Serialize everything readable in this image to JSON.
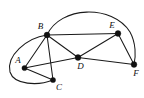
{
  "figure": {
    "width": 144,
    "height": 98,
    "background_color": "#ffffff",
    "stroke_color": "#1a1a1a",
    "vertex_color": "#111111"
  },
  "graph": {
    "vertices": [
      {
        "id": "A",
        "label": "A",
        "x": 24.5,
        "y": 68.0,
        "label_x": 18.0,
        "label_y": 60.5,
        "r": 2.6
      },
      {
        "id": "B",
        "label": "B",
        "x": 47.0,
        "y": 35.0,
        "label_x": 40.5,
        "label_y": 26.5,
        "r": 2.9
      },
      {
        "id": "C",
        "label": "C",
        "x": 53.0,
        "y": 80.0,
        "label_x": 59.0,
        "label_y": 87.5,
        "r": 2.6
      },
      {
        "id": "D",
        "label": "D",
        "x": 78.0,
        "y": 57.5,
        "label_x": 80.5,
        "label_y": 66.5,
        "r": 2.9
      },
      {
        "id": "E",
        "label": "E",
        "x": 118.0,
        "y": 33.5,
        "label_x": 112.0,
        "label_y": 25.5,
        "r": 2.9
      },
      {
        "id": "F",
        "label": "F",
        "x": 134.0,
        "y": 64.5,
        "label_x": 136.0,
        "label_y": 73.5,
        "r": 2.9
      }
    ],
    "edges": [
      {
        "id": "A-B",
        "from": "A",
        "to": "B",
        "type": "line",
        "path": "M 24.5 68 L 47 35"
      },
      {
        "id": "A-C",
        "from": "A",
        "to": "C",
        "type": "line",
        "path": "M 24.5 68 L 53 80"
      },
      {
        "id": "A-D",
        "from": "A",
        "to": "D",
        "type": "line",
        "path": "M 24.5 68 L 78 57.5"
      },
      {
        "id": "B-C",
        "from": "B",
        "to": "C",
        "type": "line",
        "path": "M 47 35 L 53 80"
      },
      {
        "id": "B-D",
        "from": "B",
        "to": "D",
        "type": "line",
        "path": "M 47 35 L 78 57.5"
      },
      {
        "id": "B-E",
        "from": "B",
        "to": "E",
        "type": "line",
        "path": "M 47 35 L 118 33.5"
      },
      {
        "id": "D-E",
        "from": "D",
        "to": "E",
        "type": "line",
        "path": "M 78 57.5 L 118 33.5"
      },
      {
        "id": "D-F",
        "from": "D",
        "to": "F",
        "type": "line",
        "path": "M 78 57.5 L 134 64.5"
      },
      {
        "id": "E-F",
        "from": "E",
        "to": "F",
        "type": "line",
        "path": "M 118 33.5 L 134 64.5"
      },
      {
        "id": "B-F-curve",
        "from": "B",
        "to": "F",
        "type": "curve",
        "path": "M 47 35 C 60 6 112 4 130 32 C 136 43 136 56 134 64.5"
      },
      {
        "id": "A-C-curve",
        "from": "B",
        "to": "C",
        "type": "curve",
        "path": "M 47 35 C 26 38 6 56 10 72 C 14 85 38 86 53 80"
      }
    ],
    "edge_count": 11,
    "vertex_count": 6
  }
}
